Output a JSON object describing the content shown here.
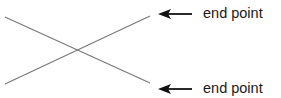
{
  "diagram": {
    "lines": [
      {
        "x1": 5,
        "y1": 17,
        "x2": 150,
        "y2": 83,
        "color": "#7a7a7a"
      },
      {
        "x1": 5,
        "y1": 84,
        "x2": 150,
        "y2": 16,
        "color": "#7a7a7a"
      }
    ],
    "arrows": [
      {
        "x_tail": 192,
        "x_head": 158,
        "y": 14,
        "color": "#111111"
      },
      {
        "x_tail": 192,
        "x_head": 158,
        "y": 89,
        "color": "#111111"
      }
    ],
    "labels": [
      {
        "text": "end point",
        "x": 203,
        "y": 18
      },
      {
        "text": "end point",
        "x": 203,
        "y": 93
      }
    ]
  }
}
